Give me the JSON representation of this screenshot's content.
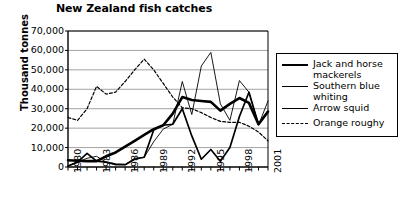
{
  "chart_data": {
    "type": "line",
    "title": "New Zealand fish catches",
    "xlabel": "",
    "ylabel": "Thousand tonnes",
    "xlim": [
      1980,
      2001
    ],
    "ylim": [
      0,
      70000
    ],
    "ytick_values": [
      0,
      10000,
      20000,
      30000,
      40000,
      50000,
      60000,
      70000
    ],
    "ytick_labels": [
      "0",
      "10,000",
      "20,000",
      "30,000",
      "40,000",
      "50,000",
      "60,000",
      "70,000"
    ],
    "xtick_values": [
      1980,
      1983,
      1986,
      1989,
      1992,
      1995,
      1998,
      2001
    ],
    "xtick_labels": [
      "1980",
      "1983",
      "1986",
      "1989",
      "1992",
      "1995",
      "1998",
      "2001"
    ],
    "x": [
      1980,
      1981,
      1982,
      1983,
      1984,
      1985,
      1986,
      1987,
      1988,
      1989,
      1990,
      1991,
      1992,
      1993,
      1994,
      1995,
      1996,
      1997,
      1998,
      1999,
      2000,
      2001
    ],
    "grid": "horizontal",
    "legend_position": "right",
    "series": [
      {
        "name": "Jack and horse mackerels",
        "style": "thick-solid",
        "color": "#000000",
        "values": [
          3500,
          3200,
          3000,
          3000,
          5500,
          7500,
          10500,
          13500,
          16500,
          19500,
          21500,
          27500,
          36000,
          34500,
          34000,
          33500,
          29000,
          32500,
          35500,
          33000,
          22000,
          28500
        ]
      },
      {
        "name": "Southern blue whiting",
        "style": "medium-solid",
        "color": "#000000",
        "values": [
          500,
          2500,
          7000,
          3000,
          2500,
          1500,
          1200,
          4000,
          5000,
          19000,
          21500,
          22000,
          30000,
          16000,
          4000,
          9000,
          3000,
          10000,
          26000,
          38500,
          22000,
          28500
        ]
      },
      {
        "name": "Arrow squid",
        "style": "thin-solid",
        "color": "#000000",
        "values": [
          500,
          2500,
          4500,
          5500,
          2500,
          1000,
          1200,
          4500,
          5000,
          13000,
          19500,
          22000,
          44000,
          27000,
          52000,
          59000,
          32500,
          24000,
          44500,
          38500,
          21500,
          34000
        ]
      },
      {
        "name": "Orange roughy",
        "style": "dotted",
        "color": "#000000",
        "values": [
          25500,
          24000,
          30000,
          41500,
          37500,
          38500,
          44000,
          50000,
          55500,
          50000,
          43000,
          36000,
          30500,
          30000,
          28000,
          25500,
          23500,
          23000,
          23000,
          21000,
          18000,
          13500
        ]
      }
    ]
  },
  "legend": {
    "items": [
      {
        "label": "Jack and horse mackerels"
      },
      {
        "label": "Southern blue whiting"
      },
      {
        "label": "Arrow squid"
      },
      {
        "label": "Orange roughy"
      }
    ]
  }
}
